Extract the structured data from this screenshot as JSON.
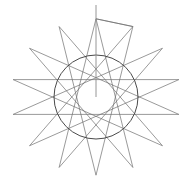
{
  "figure": {
    "canvas": {
      "width": 190,
      "height": 191,
      "background_color": "#ffffff"
    },
    "geometry": {
      "center_x": 96,
      "center_y": 97,
      "outer_radius": 85,
      "circle_radius": 42,
      "point_count": 14,
      "skip_step": 6,
      "rotation_degrees": -90,
      "vertical_squash": 0.92
    },
    "styles": {
      "star_stroke_color": "#6e6e6e",
      "star_stroke_width": 0.7,
      "circle_stroke_color": "#4a4a4a",
      "circle_stroke_width": 1.0,
      "radius_stroke_color": "#8a8a8a",
      "radius_stroke_width": 0.9
    },
    "radius_marker": {
      "from_x": 96,
      "from_y": 5,
      "to_x": 96,
      "to_y": 97
    },
    "labels": {
      "alt_text": "Fourteen-pointed star polygon circumscribing a circle, with a vertical radius line from the top apex to the center"
    }
  }
}
